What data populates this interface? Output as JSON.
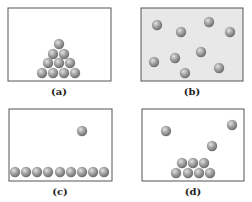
{
  "panels": [
    {
      "id": "a",
      "label": "(a)",
      "box": [
        8,
        8,
        103,
        73
      ],
      "fill": "#ffffff",
      "balls": [
        [
          59,
          44
        ],
        [
          53,
          54
        ],
        [
          64,
          54
        ],
        [
          48,
          63
        ],
        [
          59,
          63
        ],
        [
          70,
          63
        ],
        [
          42,
          73
        ],
        [
          53,
          73
        ],
        [
          64,
          73
        ],
        [
          75,
          73
        ]
      ]
    },
    {
      "id": "b",
      "label": "(b)",
      "box": [
        141,
        8,
        102,
        73
      ],
      "fill": "#e8e8e8",
      "balls": [
        [
          157,
          25
        ],
        [
          181,
          32
        ],
        [
          209,
          22
        ],
        [
          230,
          32
        ],
        [
          175,
          58
        ],
        [
          201,
          52
        ],
        [
          154,
          62
        ],
        [
          185,
          73
        ],
        [
          219,
          68
        ]
      ]
    },
    {
      "id": "c",
      "label": "(c)",
      "box": [
        9,
        109,
        103,
        72
      ],
      "fill": "#ffffff",
      "balls": [
        [
          82,
          131
        ],
        [
          15,
          172
        ],
        [
          26,
          172
        ],
        [
          37,
          172
        ],
        [
          48,
          172
        ],
        [
          60,
          172
        ],
        [
          71,
          172
        ],
        [
          82,
          172
        ],
        [
          93,
          172
        ],
        [
          104,
          172
        ]
      ]
    },
    {
      "id": "d",
      "label": "(d)",
      "box": [
        142,
        109,
        102,
        72
      ],
      "fill": "#ffffff",
      "balls": [
        [
          166,
          131
        ],
        [
          232,
          125
        ],
        [
          212,
          146
        ],
        [
          182,
          163
        ],
        [
          193,
          163
        ],
        [
          204,
          163
        ],
        [
          176,
          173
        ],
        [
          188,
          173
        ],
        [
          199,
          173
        ],
        [
          210,
          173
        ]
      ]
    }
  ],
  "labels": {
    "a": "(a)",
    "b": "(b)",
    "c": "(c)",
    "d": "(d)"
  },
  "colors": {
    "ball": "#9a9a9a",
    "ball_highlight": "#d8d8d8",
    "border": "#555555"
  }
}
